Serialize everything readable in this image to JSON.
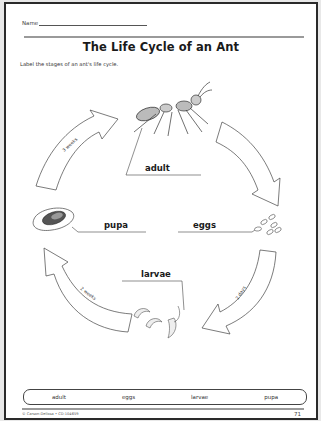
{
  "worksheet": {
    "name_label": "Name",
    "title": "The Life Cycle of an Ant",
    "instructions": "Label the stages of an ant's life cycle."
  },
  "diagram": {
    "stages": [
      {
        "id": "adult",
        "label": "adult",
        "illustration": "ant-adult"
      },
      {
        "id": "eggs",
        "label": "eggs",
        "illustration": "ant-eggs"
      },
      {
        "id": "larvae",
        "label": "larvae",
        "illustration": "ant-larvae"
      },
      {
        "id": "pupa",
        "label": "pupa",
        "illustration": "ant-pupa"
      }
    ],
    "arrows": [
      {
        "from": "pupa",
        "to": "adult",
        "duration": "3 weeks"
      },
      {
        "from": "adult",
        "to": "eggs",
        "duration": ""
      },
      {
        "from": "eggs",
        "to": "larvae",
        "duration": "2 days"
      },
      {
        "from": "larvae",
        "to": "pupa",
        "duration": "2 weeks"
      }
    ]
  },
  "word_bank": [
    "adult",
    "eggs",
    "larvae",
    "pupa"
  ],
  "footer": {
    "copyright": "© Carson-Dellosa • CD-104659",
    "page_number": "71"
  },
  "colors": {
    "ink": "#1a1a1a",
    "rule": "#9a9a9a",
    "border": "#2a2a2a",
    "paper": "#ffffff"
  }
}
